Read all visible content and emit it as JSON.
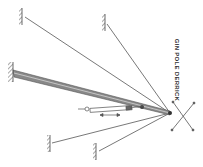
{
  "diagram": {
    "title": "GIN POLE DERRICK",
    "colors": {
      "line": "#555555",
      "pole": "#777777",
      "background": "#ffffff"
    },
    "apex": {
      "x": 170,
      "y": 113
    },
    "anchors": [
      {
        "name": "guy-anchor-top-left",
        "x": 23,
        "y": 16
      },
      {
        "name": "guy-anchor-top-mid",
        "x": 105,
        "y": 23
      },
      {
        "name": "pole-base",
        "x": 13,
        "y": 73
      },
      {
        "name": "guy-anchor-bottom-left",
        "x": 50,
        "y": 143
      },
      {
        "name": "guy-anchor-bottom-mid",
        "x": 97,
        "y": 151
      }
    ]
  }
}
